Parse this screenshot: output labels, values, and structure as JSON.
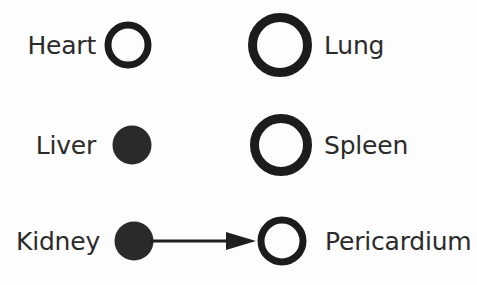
{
  "diagram": {
    "background_color": "#fdfdfd",
    "stroke_color": "#1c1c1c",
    "text_color": "#2b2b2b",
    "fill_color": "#2a2a2a",
    "rows": [
      {
        "left_label": "Heart",
        "left_node": {
          "shape": "circle",
          "fill": "hollow",
          "diameter": 47,
          "stroke_width": 7
        },
        "right_node": {
          "shape": "circle",
          "fill": "hollow",
          "diameter": 64,
          "stroke_width": 9
        },
        "right_label": "Lung",
        "connector": "none"
      },
      {
        "left_label": "Liver",
        "left_node": {
          "shape": "circle",
          "fill": "filled",
          "diameter": 39,
          "stroke_width": 0
        },
        "right_node": {
          "shape": "circle",
          "fill": "hollow",
          "diameter": 62,
          "stroke_width": 9
        },
        "right_label": "Spleen",
        "connector": "none"
      },
      {
        "left_label": "Kidney",
        "left_node": {
          "shape": "circle",
          "fill": "filled",
          "diameter": 39,
          "stroke_width": 0
        },
        "right_node": {
          "shape": "circle",
          "fill": "hollow",
          "diameter": 49,
          "stroke_width": 7
        },
        "right_label": "Pericardium",
        "connector": "arrow-right"
      }
    ]
  }
}
